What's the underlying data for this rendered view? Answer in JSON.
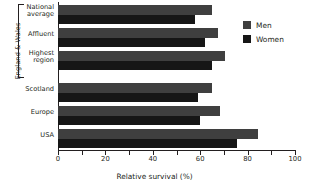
{
  "chart_data": {
    "type": "bar",
    "orientation": "horizontal",
    "title": "",
    "xlabel": "Relative survival (%)",
    "ylabel": "",
    "xlim": [
      0,
      100
    ],
    "xticks": [
      0,
      10,
      20,
      30,
      40,
      50,
      60,
      70,
      80,
      90,
      100
    ],
    "xtick_labels": [
      "0",
      "",
      "20",
      "",
      "40",
      "",
      "60",
      "",
      "80",
      "",
      "100"
    ],
    "grid": false,
    "legend_position": "top-right",
    "categories": [
      "National average",
      "Affluent",
      "Highest region",
      "Scotland",
      "Europe",
      "USA"
    ],
    "series": [
      {
        "name": "Men",
        "color": "#3f3f3f",
        "values": [
          65,
          67.5,
          70.5,
          65,
          68.5,
          84.5
        ]
      },
      {
        "name": "Women",
        "color": "#161616",
        "values": [
          58,
          62,
          65,
          59,
          60,
          75.5
        ]
      }
    ],
    "group_bracket": {
      "label": "England & Wales",
      "covers": [
        "National average",
        "Affluent",
        "Highest region"
      ]
    }
  },
  "axis": {
    "x_title": "Relative survival (%)",
    "tick_labels": [
      {
        "value": 0,
        "text": "0"
      },
      {
        "value": 10,
        "text": ""
      },
      {
        "value": 20,
        "text": "20"
      },
      {
        "value": 30,
        "text": ""
      },
      {
        "value": 40,
        "text": "40"
      },
      {
        "value": 50,
        "text": ""
      },
      {
        "value": 60,
        "text": "60"
      },
      {
        "value": 70,
        "text": ""
      },
      {
        "value": 80,
        "text": "80"
      },
      {
        "value": 90,
        "text": ""
      },
      {
        "value": 100,
        "text": "100"
      }
    ]
  },
  "categories": [
    {
      "line1": "National",
      "line2": "average"
    },
    {
      "line1": "Affluent",
      "line2": ""
    },
    {
      "line1": "Highest",
      "line2": "region"
    },
    {
      "line1": "Scotland",
      "line2": ""
    },
    {
      "line1": "Europe",
      "line2": ""
    },
    {
      "line1": "USA",
      "line2": ""
    }
  ],
  "bracket": {
    "label": "England & Wales"
  },
  "legend": {
    "items": [
      {
        "label": "Men",
        "color": "#3f3f3f"
      },
      {
        "label": "Women",
        "color": "#161616"
      }
    ]
  }
}
